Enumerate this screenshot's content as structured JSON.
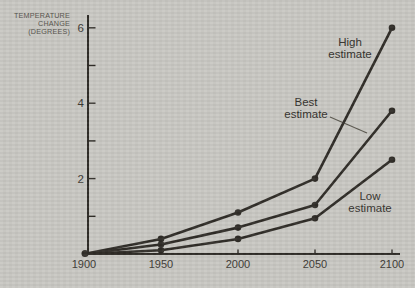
{
  "figure": {
    "background_color": "#c9c8c3",
    "line_color": "#2f2c27",
    "tick_text_color": "#403d37",
    "leader_line_color": "#5a574f"
  },
  "chart_data": {
    "type": "line",
    "title": "",
    "ylabel_lines": [
      "TEMPERATURE",
      "CHANGE",
      "(DEGREES)"
    ],
    "xlabel": "",
    "x_categories": [
      "1900",
      "1950",
      "2000",
      "2050",
      "2100"
    ],
    "ylim": [
      0,
      6.4
    ],
    "grid": false,
    "legend_position": "inline-annotations",
    "y_ticks": [
      {
        "value": 1,
        "label": ""
      },
      {
        "value": 2,
        "label": "2"
      },
      {
        "value": 3,
        "label": ""
      },
      {
        "value": 4,
        "label": "4"
      },
      {
        "value": 5,
        "label": ""
      },
      {
        "value": 6,
        "label": "6"
      }
    ],
    "series": [
      {
        "name": "High estimate",
        "values": [
          0,
          0.4,
          1.1,
          2.0,
          6.0
        ]
      },
      {
        "name": "Best estimate",
        "values": [
          0,
          0.25,
          0.7,
          1.3,
          3.8
        ]
      },
      {
        "name": "Low estimate",
        "values": [
          0,
          0.1,
          0.4,
          0.95,
          2.5
        ]
      }
    ],
    "annotations": [
      {
        "id": "high",
        "lines": [
          "High",
          "estimate"
        ]
      },
      {
        "id": "best",
        "lines": [
          "Best",
          "estimate"
        ],
        "has_leader_line": true
      },
      {
        "id": "low",
        "lines": [
          "Low",
          "estimate"
        ]
      }
    ]
  }
}
